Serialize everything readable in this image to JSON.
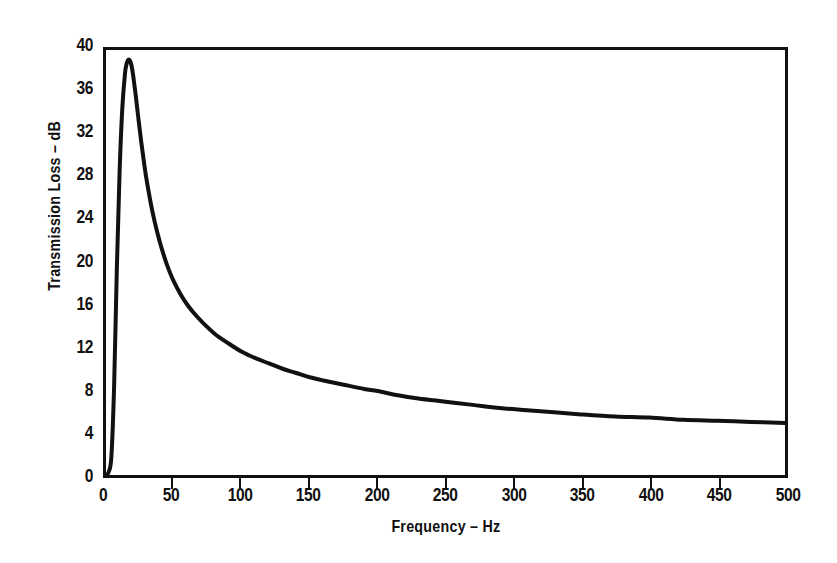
{
  "chart_data": {
    "type": "line",
    "title": "",
    "xlabel": "Frequency – Hz",
    "ylabel": "Transmission Loss – dB",
    "xlim": [
      0,
      500
    ],
    "ylim": [
      0,
      40
    ],
    "grid": false,
    "legend": null,
    "line_color": "#111111",
    "line_width_px": 4,
    "xticks": [
      0,
      50,
      100,
      150,
      200,
      250,
      300,
      350,
      400,
      450,
      500
    ],
    "xtick_labels": [
      "0",
      "50",
      "100",
      "150",
      "200",
      "250",
      "300",
      "350",
      "400",
      "450",
      "500"
    ],
    "yticks": [
      0,
      4,
      8,
      12,
      16,
      20,
      24,
      28,
      32,
      36,
      40
    ],
    "ytick_labels": [
      "0",
      "4",
      "8",
      "12",
      "16",
      "20",
      "24",
      "28",
      "32",
      "36",
      "40"
    ],
    "series": [
      {
        "name": "Transmission Loss",
        "x": [
          0,
          2,
          4,
          6,
          8,
          10,
          12,
          14,
          15,
          16,
          17,
          18,
          19,
          20,
          22,
          24,
          26,
          28,
          30,
          34,
          38,
          42,
          46,
          50,
          55,
          60,
          65,
          70,
          80,
          90,
          100,
          110,
          120,
          130,
          140,
          150,
          160,
          175,
          190,
          200,
          215,
          230,
          250,
          270,
          290,
          310,
          330,
          350,
          375,
          400,
          425,
          450,
          475,
          500
        ],
        "y": [
          0,
          0.3,
          1.8,
          8.5,
          19.5,
          28.5,
          34.5,
          37.8,
          38.6,
          39.0,
          39.1,
          38.9,
          38.4,
          37.6,
          35.6,
          33.4,
          31.3,
          29.4,
          27.7,
          24.9,
          22.7,
          20.9,
          19.4,
          18.2,
          17.0,
          16.0,
          15.2,
          14.5,
          13.3,
          12.4,
          11.6,
          11.0,
          10.5,
          10.0,
          9.6,
          9.2,
          8.9,
          8.5,
          8.1,
          7.9,
          7.5,
          7.2,
          6.9,
          6.6,
          6.3,
          6.1,
          5.9,
          5.7,
          5.5,
          5.4,
          5.2,
          5.1,
          5.0,
          4.9
        ]
      }
    ],
    "annotations": [
      {
        "text": "resonance peak",
        "x": 17,
        "y": 39.1,
        "rendered": false
      }
    ]
  },
  "axes": {
    "x_title": "Frequency – Hz",
    "y_title": "Transmission Loss – dB"
  }
}
